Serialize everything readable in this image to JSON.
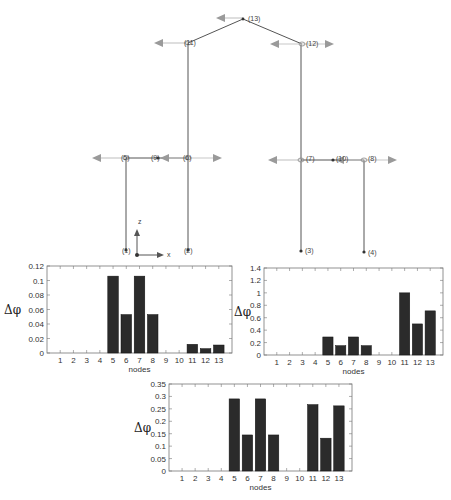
{
  "diagram": {
    "colors": {
      "member": "#555555",
      "arrow": "#9a9a9a",
      "arrow_line": "#c8c8c8",
      "node": "#333333"
    },
    "axes": {
      "z_label": "z",
      "x_label": "x"
    },
    "nodes": [
      {
        "id": "1",
        "label": "(1)",
        "x": 126,
        "y": 250
      },
      {
        "id": "2",
        "label": "(2)",
        "x": 188,
        "y": 250
      },
      {
        "id": "3",
        "label": "(3)",
        "x": 301,
        "y": 251
      },
      {
        "id": "4",
        "label": "(4)",
        "x": 364,
        "y": 252
      },
      {
        "id": "5",
        "label": "(5)",
        "x": 126,
        "y": 158
      },
      {
        "id": "6",
        "label": "(6)",
        "x": 188,
        "y": 158
      },
      {
        "id": "7",
        "label": "(7)",
        "x": 301,
        "y": 160
      },
      {
        "id": "8",
        "label": "(8)",
        "x": 364,
        "y": 160
      },
      {
        "id": "9",
        "label": "(9)",
        "x": 158,
        "y": 158
      },
      {
        "id": "10",
        "label": "(10)",
        "x": 333,
        "y": 160
      },
      {
        "id": "11",
        "label": "(11)",
        "x": 188,
        "y": 43
      },
      {
        "id": "12",
        "label": "(12)",
        "x": 302,
        "y": 44
      },
      {
        "id": "13",
        "label": "(13)",
        "x": 243,
        "y": 19
      }
    ]
  },
  "chart_data": [
    {
      "type": "bar",
      "title": "",
      "xlabel": "nodes",
      "ylabel": "Δφ",
      "categories": [
        "1",
        "2",
        "3",
        "4",
        "5",
        "6",
        "7",
        "8",
        "9",
        "10",
        "11",
        "12",
        "13"
      ],
      "values": [
        0,
        0,
        0,
        0,
        0.106,
        0.053,
        0.106,
        0.053,
        0,
        0,
        0.012,
        0.006,
        0.011
      ],
      "ylim": [
        0,
        0.12
      ],
      "yticks": [
        "0",
        "0.02",
        "0.04",
        "0.06",
        "0.08",
        "0.1",
        "0.12"
      ],
      "grid": false,
      "bar_color": "#2b2b2b"
    },
    {
      "type": "bar",
      "title": "",
      "xlabel": "nodes",
      "ylabel": "Δφ",
      "categories": [
        "1",
        "2",
        "3",
        "4",
        "5",
        "6",
        "7",
        "8",
        "9",
        "10",
        "11",
        "12",
        "13"
      ],
      "values": [
        0,
        0,
        0,
        0,
        0.29,
        0.15,
        0.29,
        0.15,
        0,
        0,
        1.0,
        0.5,
        0.71
      ],
      "ylim": [
        0,
        1.4
      ],
      "yticks": [
        "0",
        "0.2",
        "0.4",
        "0.6",
        "0.8",
        "1",
        "1.2",
        "1.4"
      ],
      "grid": false,
      "bar_color": "#2b2b2b"
    },
    {
      "type": "bar",
      "title": "",
      "xlabel": "nodes",
      "ylabel": "Δφ",
      "categories": [
        "1",
        "2",
        "3",
        "4",
        "5",
        "6",
        "7",
        "8",
        "9",
        "10",
        "11",
        "12",
        "13"
      ],
      "values": [
        0,
        0,
        0,
        0,
        0.29,
        0.145,
        0.29,
        0.145,
        0,
        0,
        0.267,
        0.132,
        0.262
      ],
      "ylim": [
        0,
        0.35
      ],
      "yticks": [
        "0",
        "0.05",
        "0.1",
        "0.15",
        "0.2",
        "0.25",
        "0.3",
        "0.35"
      ],
      "grid": false,
      "bar_color": "#2b2b2b"
    }
  ]
}
